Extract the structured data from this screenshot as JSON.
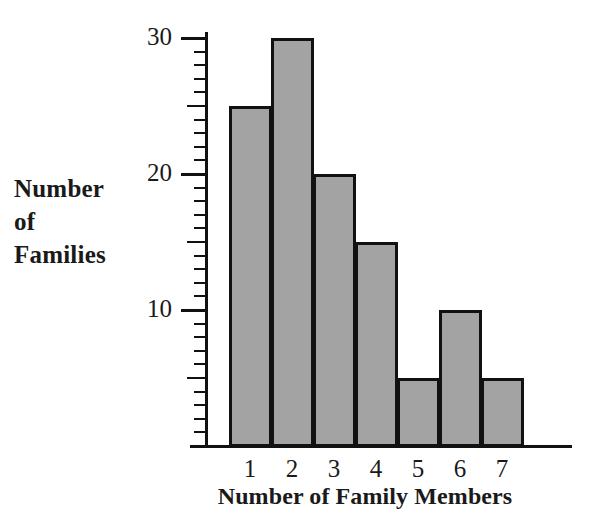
{
  "chart_data": {
    "type": "bar",
    "title": "",
    "xlabel": "Number of Family Members",
    "ylabel": "Number of Families",
    "ylabel_lines": [
      "Number",
      "of",
      "Families"
    ],
    "categories": [
      "1",
      "2",
      "3",
      "4",
      "5",
      "6",
      "7"
    ],
    "values": [
      25,
      30,
      20,
      15,
      5,
      10,
      5
    ],
    "ylim": [
      0,
      30
    ],
    "xlim_labels": [
      "1",
      "7"
    ],
    "y_major_ticks": [
      10,
      20,
      30
    ],
    "y_major_tick_labels": [
      "10",
      "20",
      "30"
    ],
    "y_minor_tick_step": 1,
    "grid": false,
    "legend": null,
    "bar_fill_color": "#a3a3a3",
    "bar_edge_color": "#111111",
    "axis_color": "#111111",
    "background_color": "#ffffff",
    "text_color": "#1a1a1a"
  }
}
